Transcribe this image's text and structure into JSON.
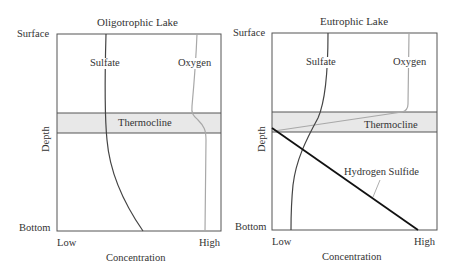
{
  "panels": [
    {
      "id": "oligotrophic",
      "title": "Oligotrophic Lake",
      "y_top_label": "Surface",
      "y_bottom_label": "Bottom",
      "y_axis_label": "Depth",
      "x_low_label": "Low",
      "x_high_label": "High",
      "x_axis_label": "Concentration",
      "thermocline_label": "Thermocline",
      "curves": [
        {
          "name": "Sulfate",
          "label": "Sulfate"
        },
        {
          "name": "Oxygen",
          "label": "Oxygen"
        }
      ]
    },
    {
      "id": "eutrophic",
      "title": "Eutrophic Lake",
      "y_top_label": "Surface",
      "y_bottom_label": "Bottom",
      "y_axis_label": "Depth",
      "x_low_label": "Low",
      "x_high_label": "High",
      "x_axis_label": "Concentration",
      "thermocline_label": "Thermocline",
      "curves": [
        {
          "name": "Sulfate",
          "label": "Sulfate"
        },
        {
          "name": "Oxygen",
          "label": "Oxygen"
        },
        {
          "name": "Hydrogen Sulfide",
          "label": "Hydrogen Sulfide"
        }
      ]
    }
  ],
  "colors": {
    "frame": "#555555",
    "thermocline_fill": "#e8e8e8",
    "sulfate": "#444444",
    "oxygen": "#a8a8a8",
    "hydrogen_sulfide": "#111111"
  }
}
